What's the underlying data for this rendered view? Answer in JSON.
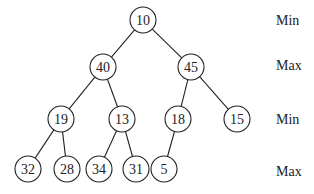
{
  "diagram": {
    "type": "min-max-heap",
    "node_radius": 13,
    "nodes": [
      {
        "id": "n10",
        "value": "10",
        "x": 143,
        "y": 20
      },
      {
        "id": "n40",
        "value": "40",
        "x": 103,
        "y": 67
      },
      {
        "id": "n45",
        "value": "45",
        "x": 191,
        "y": 67
      },
      {
        "id": "n19",
        "value": "19",
        "x": 61,
        "y": 119
      },
      {
        "id": "n13",
        "value": "13",
        "x": 122,
        "y": 119
      },
      {
        "id": "n18",
        "value": "18",
        "x": 178,
        "y": 119
      },
      {
        "id": "n15",
        "value": "15",
        "x": 237,
        "y": 119
      },
      {
        "id": "n32",
        "value": "32",
        "x": 28,
        "y": 169
      },
      {
        "id": "n28",
        "value": "28",
        "x": 67,
        "y": 169
      },
      {
        "id": "n34",
        "value": "34",
        "x": 99,
        "y": 169
      },
      {
        "id": "n31",
        "value": "31",
        "x": 136,
        "y": 169
      },
      {
        "id": "n5",
        "value": "5",
        "x": 164,
        "y": 169
      }
    ],
    "edges": [
      [
        "n10",
        "n40"
      ],
      [
        "n10",
        "n45"
      ],
      [
        "n40",
        "n19"
      ],
      [
        "n40",
        "n13"
      ],
      [
        "n45",
        "n18"
      ],
      [
        "n45",
        "n15"
      ],
      [
        "n19",
        "n32"
      ],
      [
        "n19",
        "n28"
      ],
      [
        "n13",
        "n34"
      ],
      [
        "n13",
        "n31"
      ],
      [
        "n18",
        "n5"
      ]
    ],
    "level_labels": [
      {
        "text": "Min",
        "x": 276,
        "y": 20
      },
      {
        "text": "Max",
        "x": 276,
        "y": 65
      },
      {
        "text": "Min",
        "x": 276,
        "y": 119
      },
      {
        "text": "Max",
        "x": 276,
        "y": 171
      }
    ]
  }
}
